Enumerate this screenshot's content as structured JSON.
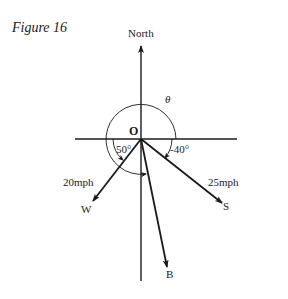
{
  "figure": {
    "title": "Figure 16"
  },
  "diagram": {
    "origin_label": "O",
    "north_label": "North",
    "theta_label": "θ",
    "vectors": [
      {
        "name": "W",
        "label": "W",
        "speed_label": "20mph",
        "angle_label": "50°"
      },
      {
        "name": "S",
        "label": "S",
        "speed_label": "25mph",
        "angle_label": "-40°"
      },
      {
        "name": "B",
        "label": "B"
      }
    ]
  },
  "colors": {
    "ink": "#1a1a1a",
    "background": "#ffffff"
  }
}
